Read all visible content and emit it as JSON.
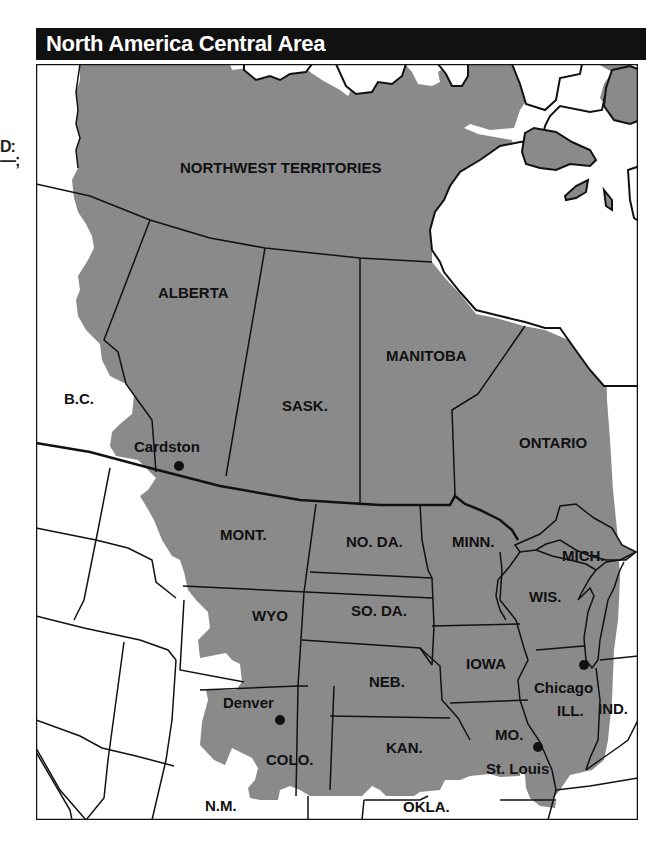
{
  "title": "North America Central Area",
  "edge_fragment": [
    "D:",
    "—;"
  ],
  "colors": {
    "region_fill": "#8a8a8a",
    "background": "#ffffff",
    "border": "#111111",
    "title_bar": "#111111",
    "title_text": "#ffffff"
  },
  "map": {
    "highlighted_regions": [
      "NORTHWEST TERRITORIES",
      "ALBERTA",
      "SASK.",
      "MANITOBA",
      "ONTARIO",
      "MONT.",
      "NO. DA.",
      "MINN.",
      "MICH.",
      "WIS.",
      "WYO",
      "SO. DA.",
      "IOWA",
      "NEB.",
      "ILL.",
      "COLO.",
      "KAN.",
      "MO."
    ],
    "labels": {
      "nwt": "NORTHWEST TERRITORIES",
      "alberta": "ALBERTA",
      "bc": "B.C.",
      "manitoba": "MANITOBA",
      "sask": "SASK.",
      "ontario": "ONTARIO",
      "mont": "MONT.",
      "noda": "NO. DA.",
      "minn": "MINN.",
      "mich": "MICH.",
      "wis": "WIS.",
      "wyo": "WYO",
      "soda": "SO. DA.",
      "iowa": "IOWA",
      "neb": "NEB.",
      "ill": "ILL.",
      "ind": "IND.",
      "colo": "COLO.",
      "kan": "KAN.",
      "mo": "MO.",
      "nm": "N.M.",
      "okla": "OKLA."
    },
    "cities": [
      {
        "name": "Cardston",
        "x": 179,
        "y": 466
      },
      {
        "name": "Denver",
        "x": 280,
        "y": 720
      },
      {
        "name": "Chicago",
        "x": 584,
        "y": 665
      },
      {
        "name": "St. Louis",
        "x": 538,
        "y": 747
      }
    ]
  }
}
